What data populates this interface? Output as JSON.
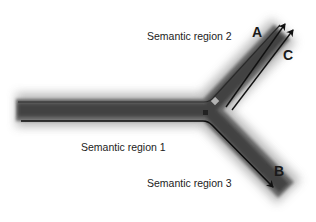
{
  "diagram": {
    "type": "branching-tube",
    "regions": [
      {
        "id": 1,
        "label": "Semantic region 1"
      },
      {
        "id": 2,
        "label": "Semantic region 2"
      },
      {
        "id": 3,
        "label": "Semantic region 3"
      }
    ],
    "arrows": [
      {
        "label": "A",
        "branch": "upper"
      },
      {
        "label": "C",
        "branch": "upper"
      },
      {
        "label": "B",
        "branch": "lower"
      }
    ],
    "colors": {
      "tube_core": "#3a3a3a",
      "tube_glow": "#9a9a9a",
      "line": "#111111",
      "text": "#222222",
      "background": "#ffffff"
    }
  }
}
